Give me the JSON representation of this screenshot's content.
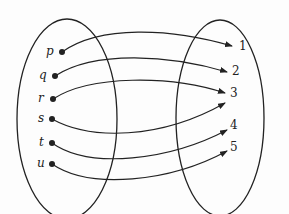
{
  "diagram": {
    "type": "function-mapping",
    "domain_set": {
      "elements": [
        {
          "label": "p",
          "x": 62,
          "y": 52
        },
        {
          "label": "q",
          "x": 55,
          "y": 76
        },
        {
          "label": "r",
          "x": 53,
          "y": 99
        },
        {
          "label": "s",
          "x": 52,
          "y": 119
        },
        {
          "label": "t",
          "x": 52,
          "y": 143
        },
        {
          "label": "u",
          "x": 52,
          "y": 164
        }
      ]
    },
    "codomain_set": {
      "elements": [
        {
          "label": "1",
          "x": 236,
          "y": 46
        },
        {
          "label": "2",
          "x": 230,
          "y": 72
        },
        {
          "label": "3",
          "x": 228,
          "y": 93
        },
        {
          "label": "4",
          "x": 230,
          "y": 126
        },
        {
          "label": "5",
          "x": 230,
          "y": 148
        }
      ]
    },
    "mappings": [
      {
        "from": "p",
        "to": "1"
      },
      {
        "from": "q",
        "to": "2"
      },
      {
        "from": "r",
        "to": "3"
      },
      {
        "from": "s",
        "to": "3"
      },
      {
        "from": "t",
        "to": "4"
      },
      {
        "from": "u",
        "to": "5"
      }
    ],
    "colors": {
      "stroke": "#222222",
      "background": "#fdfdfd"
    }
  }
}
